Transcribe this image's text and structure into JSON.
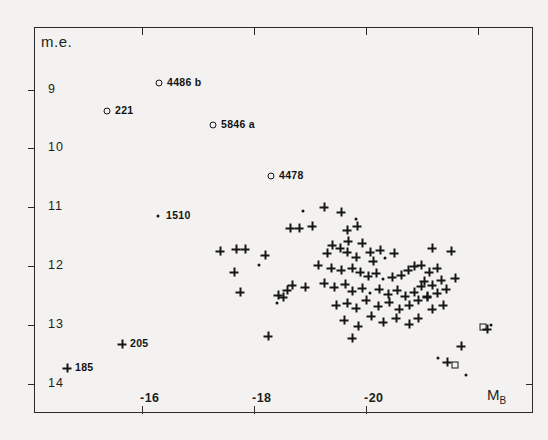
{
  "figure": {
    "background_color": "#f3f2f0",
    "ink_color": "#1d1d1d",
    "y_axis_title": "m.e.",
    "x_axis_title_base": "M",
    "x_axis_title_sub": "B"
  },
  "chart_data": {
    "type": "scatter",
    "title": "",
    "xlabel": "M_B",
    "ylabel": "m.e.",
    "xlim": [
      -14.5,
      -22.5
    ],
    "ylim": [
      14.6,
      8.2
    ],
    "y_inverted": true,
    "x_inverted": true,
    "grid": false,
    "legend_position": "none",
    "xticks": [
      -16,
      -18,
      -20
    ],
    "xtick_labels": [
      "-16",
      "-18",
      "-20"
    ],
    "yticks": [
      9,
      10,
      11,
      12,
      13,
      14
    ],
    "ytick_labels": [
      "9",
      "10",
      "11",
      "12",
      "13",
      "14"
    ],
    "marker_styles": {
      "circle": "open circle",
      "plus": "plus sign",
      "dot": "filled dot",
      "square": "open square"
    },
    "annotations": [
      {
        "label": "4486 b",
        "marker": "circle",
        "px": 159,
        "py": 83
      },
      {
        "label": "221",
        "marker": "circle",
        "px": 107,
        "py": 111
      },
      {
        "label": "5846 a",
        "marker": "circle",
        "px": 213,
        "py": 125
      },
      {
        "label": "4478",
        "marker": "circle",
        "px": 271,
        "py": 176
      },
      {
        "label": "1510",
        "marker": "dot",
        "px": 158,
        "py": 216
      },
      {
        "label": "205",
        "marker": "plus",
        "px": 122,
        "py": 344
      },
      {
        "label": "185",
        "marker": "plus",
        "px": 67,
        "py": 368
      }
    ],
    "points": [
      {
        "m": "circle",
        "px": 159,
        "py": 83
      },
      {
        "m": "circle",
        "px": 107,
        "py": 111
      },
      {
        "m": "circle",
        "px": 213,
        "py": 125
      },
      {
        "m": "circle",
        "px": 271,
        "py": 176
      },
      {
        "m": "dot",
        "px": 158,
        "py": 216
      },
      {
        "m": "plus",
        "px": 122,
        "py": 344
      },
      {
        "m": "plus",
        "px": 67,
        "py": 368
      },
      {
        "m": "plus",
        "px": 220,
        "py": 251
      },
      {
        "m": "plus",
        "px": 236,
        "py": 249
      },
      {
        "m": "plus",
        "px": 245,
        "py": 249
      },
      {
        "m": "plus",
        "px": 234,
        "py": 272
      },
      {
        "m": "plus",
        "px": 240,
        "py": 292
      },
      {
        "m": "plus",
        "px": 265,
        "py": 255
      },
      {
        "m": "dot",
        "px": 259,
        "py": 265
      },
      {
        "m": "plus",
        "px": 278,
        "py": 295
      },
      {
        "m": "plus",
        "px": 283,
        "py": 297
      },
      {
        "m": "plus",
        "px": 287,
        "py": 290
      },
      {
        "m": "dot",
        "px": 277,
        "py": 303
      },
      {
        "m": "plus",
        "px": 268,
        "py": 336
      },
      {
        "m": "plus",
        "px": 292,
        "py": 285
      },
      {
        "m": "plus",
        "px": 305,
        "py": 287
      },
      {
        "m": "dot",
        "px": 303,
        "py": 211
      },
      {
        "m": "plus",
        "px": 324,
        "py": 207
      },
      {
        "m": "plus",
        "px": 290,
        "py": 228
      },
      {
        "m": "plus",
        "px": 299,
        "py": 228
      },
      {
        "m": "plus",
        "px": 312,
        "py": 226
      },
      {
        "m": "plus",
        "px": 341,
        "py": 212
      },
      {
        "m": "plus",
        "px": 347,
        "py": 230
      },
      {
        "m": "plus",
        "px": 357,
        "py": 226
      },
      {
        "m": "dot",
        "px": 356,
        "py": 219
      },
      {
        "m": "plus",
        "px": 348,
        "py": 241
      },
      {
        "m": "plus",
        "px": 362,
        "py": 243
      },
      {
        "m": "plus",
        "px": 340,
        "py": 248
      },
      {
        "m": "plus",
        "px": 332,
        "py": 245
      },
      {
        "m": "plus",
        "px": 327,
        "py": 253
      },
      {
        "m": "plus",
        "px": 347,
        "py": 252
      },
      {
        "m": "plus",
        "px": 356,
        "py": 257
      },
      {
        "m": "plus",
        "px": 370,
        "py": 252
      },
      {
        "m": "plus",
        "px": 380,
        "py": 250
      },
      {
        "m": "plus",
        "px": 373,
        "py": 261
      },
      {
        "m": "dot",
        "px": 385,
        "py": 258
      },
      {
        "m": "plus",
        "px": 394,
        "py": 253
      },
      {
        "m": "plus",
        "px": 318,
        "py": 265
      },
      {
        "m": "plus",
        "px": 331,
        "py": 268
      },
      {
        "m": "plus",
        "px": 341,
        "py": 270
      },
      {
        "m": "plus",
        "px": 352,
        "py": 268
      },
      {
        "m": "plus",
        "px": 360,
        "py": 272
      },
      {
        "m": "plus",
        "px": 368,
        "py": 276
      },
      {
        "m": "plus",
        "px": 376,
        "py": 273
      },
      {
        "m": "dot",
        "px": 383,
        "py": 279
      },
      {
        "m": "plus",
        "px": 392,
        "py": 277
      },
      {
        "m": "plus",
        "px": 401,
        "py": 275
      },
      {
        "m": "plus",
        "px": 408,
        "py": 270
      },
      {
        "m": "plus",
        "px": 414,
        "py": 266
      },
      {
        "m": "plus",
        "px": 324,
        "py": 283
      },
      {
        "m": "plus",
        "px": 334,
        "py": 287
      },
      {
        "m": "plus",
        "px": 345,
        "py": 284
      },
      {
        "m": "plus",
        "px": 352,
        "py": 291
      },
      {
        "m": "plus",
        "px": 362,
        "py": 288
      },
      {
        "m": "dot",
        "px": 370,
        "py": 293
      },
      {
        "m": "plus",
        "px": 379,
        "py": 289
      },
      {
        "m": "plus",
        "px": 388,
        "py": 294
      },
      {
        "m": "plus",
        "px": 397,
        "py": 290
      },
      {
        "m": "plus",
        "px": 405,
        "py": 296
      },
      {
        "m": "plus",
        "px": 414,
        "py": 292
      },
      {
        "m": "plus",
        "px": 421,
        "py": 286
      },
      {
        "m": "plus",
        "px": 336,
        "py": 305
      },
      {
        "m": "plus",
        "px": 347,
        "py": 303
      },
      {
        "m": "plus",
        "px": 356,
        "py": 308
      },
      {
        "m": "plus",
        "px": 366,
        "py": 300
      },
      {
        "m": "plus",
        "px": 378,
        "py": 306
      },
      {
        "m": "plus",
        "px": 389,
        "py": 302
      },
      {
        "m": "plus",
        "px": 399,
        "py": 309
      },
      {
        "m": "plus",
        "px": 409,
        "py": 305
      },
      {
        "m": "plus",
        "px": 418,
        "py": 300
      },
      {
        "m": "plus",
        "px": 427,
        "py": 296
      },
      {
        "m": "plus",
        "px": 344,
        "py": 320
      },
      {
        "m": "plus",
        "px": 358,
        "py": 326
      },
      {
        "m": "plus",
        "px": 352,
        "py": 338
      },
      {
        "m": "plus",
        "px": 371,
        "py": 316
      },
      {
        "m": "plus",
        "px": 383,
        "py": 322
      },
      {
        "m": "plus",
        "px": 396,
        "py": 318
      },
      {
        "m": "plus",
        "px": 409,
        "py": 324
      },
      {
        "m": "plus",
        "px": 418,
        "py": 318
      },
      {
        "m": "plus",
        "px": 432,
        "py": 248
      },
      {
        "m": "plus",
        "px": 421,
        "py": 265
      },
      {
        "m": "plus",
        "px": 429,
        "py": 272
      },
      {
        "m": "plus",
        "px": 437,
        "py": 268
      },
      {
        "m": "plus",
        "px": 424,
        "py": 281
      },
      {
        "m": "plus",
        "px": 432,
        "py": 285
      },
      {
        "m": "plus",
        "px": 441,
        "py": 280
      },
      {
        "m": "plus",
        "px": 427,
        "py": 297
      },
      {
        "m": "plus",
        "px": 437,
        "py": 293
      },
      {
        "m": "plus",
        "px": 446,
        "py": 289
      },
      {
        "m": "plus",
        "px": 432,
        "py": 309
      },
      {
        "m": "plus",
        "px": 443,
        "py": 305
      },
      {
        "m": "square",
        "px": 483,
        "py": 327
      },
      {
        "m": "dot",
        "px": 491,
        "py": 325
      },
      {
        "m": "plus",
        "px": 487,
        "py": 329
      },
      {
        "m": "plus",
        "px": 461,
        "py": 346
      },
      {
        "m": "dot",
        "px": 438,
        "py": 358
      },
      {
        "m": "plus",
        "px": 447,
        "py": 362
      },
      {
        "m": "square",
        "px": 455,
        "py": 365
      },
      {
        "m": "dot",
        "px": 466,
        "py": 375
      },
      {
        "m": "plus",
        "px": 451,
        "py": 251
      },
      {
        "m": "plus",
        "px": 455,
        "py": 278
      }
    ]
  }
}
